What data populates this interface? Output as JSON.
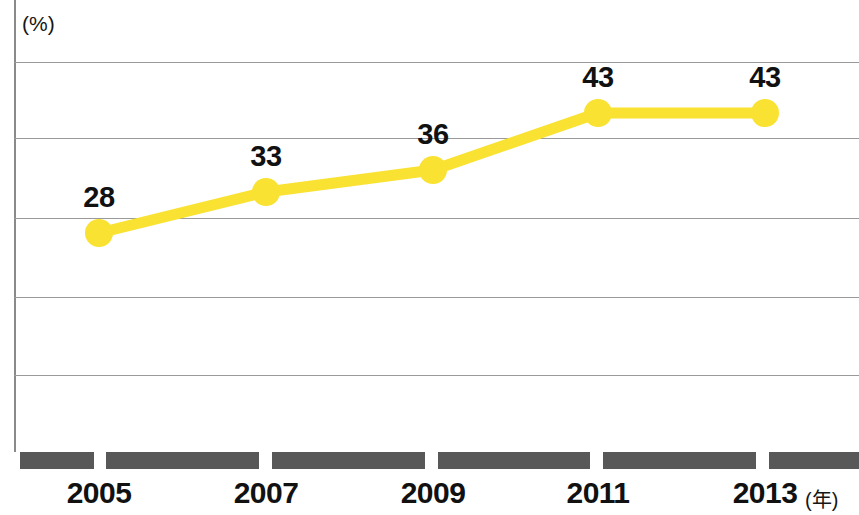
{
  "chart_data": {
    "type": "line",
    "title": "",
    "subtitle": "",
    "xlabel": "(年)",
    "ylabel": "(%)",
    "categories": [
      "2005",
      "2007",
      "2009",
      "2011",
      "2013"
    ],
    "values": [
      28,
      33,
      36,
      43,
      43
    ],
    "series": [
      {
        "name": "",
        "values": [
          28,
          33,
          36,
          43,
          43
        ],
        "color": "#f9e231",
        "marker": "circle",
        "data_labels": [
          "28",
          "33",
          "36",
          "43",
          "43"
        ]
      }
    ],
    "xlim": [
      2004,
      2014
    ],
    "ylim": [
      0,
      60
    ],
    "grid": true,
    "gridlines_y": [
      10,
      20,
      30,
      40,
      50
    ],
    "legend": "none",
    "legend_position": "none",
    "annotations": []
  },
  "axes": {
    "y_unit": "(%)",
    "x_unit": "(年)",
    "x_ticks": [
      "2005",
      "2007",
      "2009",
      "2011",
      "2013"
    ],
    "y_tick_labels": []
  },
  "points": [
    {
      "category": "2005",
      "label": "28",
      "value": 28,
      "px": 99,
      "py": 233
    },
    {
      "category": "2007",
      "label": "33",
      "value": 33,
      "px": 266,
      "py": 192
    },
    {
      "category": "2009",
      "label": "36",
      "value": 36,
      "px": 433,
      "py": 170
    },
    {
      "category": "2011",
      "label": "43",
      "value": 43,
      "px": 598,
      "py": 113
    },
    {
      "category": "2013",
      "label": "43",
      "value": 43,
      "px": 765,
      "py": 113
    }
  ],
  "style": {
    "series_color": "#f9e231",
    "axis_bar_color": "#585858",
    "gridline_color": "#9a9a9a",
    "label_color": "#111111",
    "background": "#ffffff"
  }
}
